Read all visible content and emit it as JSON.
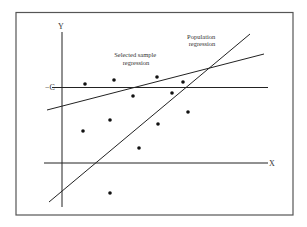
{
  "diagram": {
    "axis_labels": {
      "y": "Y",
      "x": "X",
      "c": "C"
    },
    "annotations": {
      "sample_line1": "Selected sample",
      "sample_line2": "regression",
      "population_line1": "Population",
      "population_line2": "regression"
    },
    "colors": {
      "line": "#222222",
      "frame": "#555555",
      "background": "#ffffff"
    },
    "points": [
      [
        85,
        84
      ],
      [
        114,
        80
      ],
      [
        157,
        77
      ],
      [
        183,
        82
      ],
      [
        133,
        96
      ],
      [
        172,
        93
      ],
      [
        188,
        112
      ],
      [
        110,
        120
      ],
      [
        83,
        131
      ],
      [
        158,
        124
      ],
      [
        139,
        148
      ],
      [
        110,
        193
      ]
    ]
  }
}
